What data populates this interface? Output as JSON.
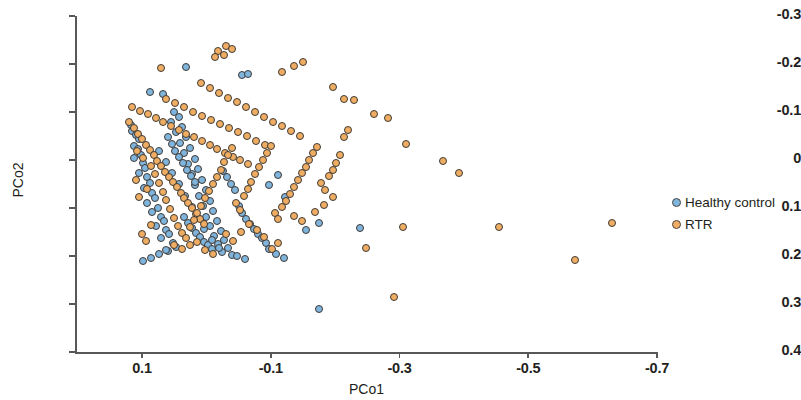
{
  "chart_data": {
    "type": "scatter",
    "title": "",
    "xlabel": "PCo1",
    "ylabel": "PCo2",
    "xlim": [
      0.16,
      -0.74
    ],
    "ylim": [
      -0.3,
      0.4
    ],
    "x_inverted": true,
    "y_inverted": true,
    "grid": false,
    "legend_position": "right",
    "xticks": [
      0.1,
      -0.1,
      -0.3,
      -0.5,
      -0.7
    ],
    "xtick_labels": [
      "0.1",
      "-0.1",
      "-0.3",
      "-0.5",
      "-0.7"
    ],
    "yticks": [
      -0.3,
      -0.2,
      -0.1,
      0,
      0.1,
      0.2,
      0.3,
      0.4
    ],
    "ytick_labels": [
      "-0.3",
      "-0.2",
      "-0.1",
      "0",
      "0.1",
      "0.2",
      "0.3",
      "0.4"
    ],
    "colors": {
      "healthy_control": "#7fb4dd",
      "rtr": "#efad63",
      "marker_edge": "#3f3a35",
      "axis": "#58585a",
      "text": "#231f20",
      "background": "#ffffff"
    },
    "series": [
      {
        "name": "Healthy control",
        "color": "#7fb4dd",
        "points": [
          [
            0.117,
            -0.072
          ],
          [
            0.115,
            -0.061
          ],
          [
            0.109,
            -0.053
          ],
          [
            0.104,
            -0.044
          ],
          [
            0.113,
            -0.03
          ],
          [
            0.106,
            -0.022
          ],
          [
            0.101,
            -0.01
          ],
          [
            0.112,
            -0.004
          ],
          [
            0.099,
            0.006
          ],
          [
            0.096,
            0.016
          ],
          [
            0.104,
            0.027
          ],
          [
            0.092,
            0.036
          ],
          [
            0.088,
            0.048
          ],
          [
            0.097,
            0.059
          ],
          [
            0.085,
            0.068
          ],
          [
            0.08,
            0.079
          ],
          [
            0.092,
            0.09
          ],
          [
            0.075,
            0.099
          ],
          [
            0.084,
            0.109
          ],
          [
            0.071,
            0.118
          ],
          [
            0.066,
            0.128
          ],
          [
            0.079,
            0.137
          ],
          [
            0.063,
            0.146
          ],
          [
            0.058,
            0.154
          ],
          [
            0.07,
            0.163
          ],
          [
            0.052,
            0.172
          ],
          [
            0.047,
            0.181
          ],
          [
            0.06,
            0.19
          ],
          [
            0.068,
            -0.137
          ],
          [
            0.05,
            -0.101
          ],
          [
            0.043,
            -0.09
          ],
          [
            0.055,
            -0.08
          ],
          [
            0.038,
            -0.069
          ],
          [
            0.047,
            -0.058
          ],
          [
            0.031,
            -0.047
          ],
          [
            0.041,
            -0.036
          ],
          [
            0.025,
            -0.025
          ],
          [
            0.035,
            -0.014
          ],
          [
            0.018,
            -0.003
          ],
          [
            0.029,
            0.008
          ],
          [
            0.013,
            0.019
          ],
          [
            0.023,
            0.03
          ],
          [
            0.007,
            0.041
          ],
          [
            0.017,
            0.052
          ],
          [
            0.001,
            0.063
          ],
          [
            0.011,
            0.074
          ],
          [
            -0.005,
            0.085
          ],
          [
            0.005,
            0.096
          ],
          [
            -0.011,
            0.107
          ],
          [
            0.0,
            0.118
          ],
          [
            -0.016,
            0.128
          ],
          [
            -0.006,
            0.138
          ],
          [
            -0.022,
            0.148
          ],
          [
            -0.012,
            0.158
          ],
          [
            -0.028,
            0.167
          ],
          [
            -0.018,
            0.176
          ],
          [
            -0.034,
            0.184
          ],
          [
            -0.024,
            0.192
          ],
          [
            -0.04,
            0.198
          ],
          [
            0.034,
            0.118
          ],
          [
            0.028,
            0.131
          ],
          [
            0.022,
            0.142
          ],
          [
            0.016,
            0.152
          ],
          [
            0.01,
            0.161
          ],
          [
            0.004,
            0.17
          ],
          [
            -0.002,
            0.178
          ],
          [
            -0.008,
            0.186
          ],
          [
            -0.05,
            0.095
          ],
          [
            -0.056,
            0.11
          ],
          [
            -0.062,
            0.122
          ],
          [
            -0.068,
            0.133
          ],
          [
            -0.074,
            0.144
          ],
          [
            -0.08,
            0.154
          ],
          [
            -0.086,
            0.163
          ],
          [
            -0.092,
            0.172
          ],
          [
            -0.044,
            0.063
          ],
          [
            -0.038,
            0.049
          ],
          [
            -0.032,
            0.035
          ],
          [
            -0.026,
            0.022
          ],
          [
            0.06,
            -0.048
          ],
          [
            0.054,
            -0.033
          ],
          [
            0.048,
            -0.019
          ],
          [
            0.042,
            -0.006
          ],
          [
            0.036,
            0.007
          ],
          [
            0.03,
            0.02
          ],
          [
            0.024,
            0.033
          ],
          [
            0.018,
            0.046
          ],
          [
            0.073,
            -0.018
          ],
          [
            0.063,
            0.005
          ],
          [
            0.053,
            0.028
          ],
          [
            0.043,
            0.051
          ],
          [
            0.033,
            0.074
          ],
          [
            0.023,
            0.097
          ],
          [
            0.013,
            0.12
          ],
          [
            0.003,
            0.143
          ],
          [
            -0.009,
            0.166
          ],
          [
            -0.019,
            0.184
          ],
          [
            0.088,
            -0.142
          ],
          [
            0.032,
            -0.193
          ],
          [
            -0.055,
            -0.178
          ],
          [
            -0.065,
            -0.18
          ],
          [
            -0.098,
            0.186
          ],
          [
            -0.108,
            0.196
          ],
          [
            -0.12,
            0.204
          ],
          [
            -0.155,
            0.145
          ],
          [
            -0.175,
            0.132
          ],
          [
            -0.238,
            0.142
          ],
          [
            -0.175,
            0.31
          ],
          [
            -0.06,
            0.206
          ],
          [
            -0.048,
            0.2
          ],
          [
            -0.098,
            0.053
          ],
          [
            -0.112,
            0.031
          ],
          [
            -0.122,
            0.078
          ],
          [
            0.098,
            0.21
          ],
          [
            0.086,
            0.205
          ],
          [
            0.074,
            0.196
          ],
          [
            0.062,
            0.188
          ]
        ]
      },
      {
        "name": "RTR",
        "color": "#efad63",
        "points": [
          [
            0.12,
            -0.08
          ],
          [
            0.112,
            -0.066
          ],
          [
            0.106,
            -0.055
          ],
          [
            0.1,
            -0.043
          ],
          [
            0.094,
            -0.032
          ],
          [
            0.088,
            -0.021
          ],
          [
            0.082,
            -0.01
          ],
          [
            0.076,
            0.002
          ],
          [
            0.07,
            0.013
          ],
          [
            0.064,
            0.024
          ],
          [
            0.058,
            0.035
          ],
          [
            0.052,
            0.046
          ],
          [
            0.046,
            0.057
          ],
          [
            0.04,
            0.068
          ],
          [
            0.034,
            0.079
          ],
          [
            0.028,
            0.09
          ],
          [
            0.022,
            0.101
          ],
          [
            0.016,
            0.112
          ],
          [
            0.01,
            0.123
          ],
          [
            0.004,
            0.134
          ],
          [
            0.115,
            -0.111
          ],
          [
            0.103,
            -0.103
          ],
          [
            0.091,
            -0.095
          ],
          [
            0.079,
            -0.087
          ],
          [
            0.067,
            -0.079
          ],
          [
            0.055,
            -0.071
          ],
          [
            0.043,
            -0.063
          ],
          [
            0.031,
            -0.055
          ],
          [
            0.019,
            -0.047
          ],
          [
            0.007,
            -0.039
          ],
          [
            -0.005,
            -0.031
          ],
          [
            -0.017,
            -0.023
          ],
          [
            -0.029,
            -0.015
          ],
          [
            -0.041,
            -0.007
          ],
          [
            -0.053,
            0.001
          ],
          [
            -0.065,
            0.009
          ],
          [
            0.063,
            -0.127
          ],
          [
            0.049,
            -0.118
          ],
          [
            0.035,
            -0.11
          ],
          [
            0.021,
            -0.101
          ],
          [
            0.007,
            -0.092
          ],
          [
            -0.007,
            -0.084
          ],
          [
            -0.021,
            -0.075
          ],
          [
            -0.035,
            -0.066
          ],
          [
            -0.049,
            -0.058
          ],
          [
            -0.063,
            -0.049
          ],
          [
            -0.077,
            -0.04
          ],
          [
            -0.091,
            -0.032
          ],
          [
            0.008,
            -0.16
          ],
          [
            -0.006,
            -0.15
          ],
          [
            -0.02,
            -0.14
          ],
          [
            -0.034,
            -0.13
          ],
          [
            -0.048,
            -0.12
          ],
          [
            -0.062,
            -0.11
          ],
          [
            -0.076,
            -0.1
          ],
          [
            -0.09,
            -0.09
          ],
          [
            -0.104,
            -0.08
          ],
          [
            -0.118,
            -0.07
          ],
          [
            -0.132,
            -0.06
          ],
          [
            -0.146,
            -0.05
          ],
          [
            -0.018,
            -0.228
          ],
          [
            -0.03,
            -0.238
          ],
          [
            -0.04,
            -0.232
          ],
          [
            -0.028,
            -0.218
          ],
          [
            -0.014,
            -0.214
          ],
          [
            0.07,
            -0.192
          ],
          [
            0.086,
            0.012
          ],
          [
            0.08,
            0.03
          ],
          [
            0.074,
            0.048
          ],
          [
            0.068,
            0.066
          ],
          [
            0.062,
            0.084
          ],
          [
            0.056,
            0.102
          ],
          [
            0.05,
            0.12
          ],
          [
            0.044,
            0.138
          ],
          [
            0.038,
            0.152
          ],
          [
            0.032,
            0.163
          ],
          [
            0.026,
            0.14
          ],
          [
            0.02,
            0.125
          ],
          [
            0.014,
            0.11
          ],
          [
            0.008,
            0.095
          ],
          [
            0.002,
            0.08
          ],
          [
            -0.004,
            0.065
          ],
          [
            -0.01,
            0.05
          ],
          [
            -0.016,
            0.035
          ],
          [
            -0.022,
            0.02
          ],
          [
            -0.028,
            0.005
          ],
          [
            -0.034,
            -0.01
          ],
          [
            -0.04,
            -0.025
          ],
          [
            -0.046,
            0.09
          ],
          [
            -0.052,
            0.105
          ],
          [
            -0.058,
            0.075
          ],
          [
            -0.064,
            0.06
          ],
          [
            -0.07,
            0.045
          ],
          [
            -0.076,
            0.03
          ],
          [
            -0.082,
            0.015
          ],
          [
            -0.088,
            0.0
          ],
          [
            -0.094,
            -0.015
          ],
          [
            -0.1,
            -0.03
          ],
          [
            -0.106,
            0.11
          ],
          [
            -0.112,
            0.122
          ],
          [
            -0.118,
            0.098
          ],
          [
            -0.124,
            0.085
          ],
          [
            -0.13,
            0.07
          ],
          [
            -0.136,
            0.056
          ],
          [
            -0.142,
            0.042
          ],
          [
            -0.148,
            0.028
          ],
          [
            -0.154,
            0.014
          ],
          [
            -0.16,
            0.0
          ],
          [
            -0.166,
            -0.014
          ],
          [
            -0.172,
            -0.028
          ],
          [
            -0.178,
            0.048
          ],
          [
            -0.184,
            0.062
          ],
          [
            -0.19,
            0.034
          ],
          [
            -0.196,
            0.02
          ],
          [
            -0.202,
            0.006
          ],
          [
            -0.208,
            -0.01
          ],
          [
            -0.214,
            -0.048
          ],
          [
            -0.22,
            -0.062
          ],
          [
            -0.118,
            -0.184
          ],
          [
            -0.136,
            -0.196
          ],
          [
            -0.15,
            -0.205
          ],
          [
            -0.196,
            -0.152
          ],
          [
            -0.214,
            -0.128
          ],
          [
            -0.23,
            -0.124
          ],
          [
            -0.26,
            -0.095
          ],
          [
            -0.282,
            -0.088
          ],
          [
            -0.31,
            -0.033
          ],
          [
            -0.392,
            0.028
          ],
          [
            -0.368,
            0.003
          ],
          [
            -0.455,
            0.14
          ],
          [
            -0.573,
            0.208
          ],
          [
            -0.63,
            0.131
          ],
          [
            -0.306,
            0.14
          ],
          [
            -0.292,
            0.285
          ],
          [
            -0.248,
            0.183
          ],
          [
            -0.182,
            0.093
          ],
          [
            -0.196,
            0.078
          ],
          [
            -0.168,
            0.108
          ],
          [
            -0.102,
            0.185
          ],
          [
            -0.112,
            0.172
          ],
          [
            -0.09,
            0.16
          ],
          [
            -0.078,
            0.146
          ],
          [
            -0.066,
            0.133
          ],
          [
            0.05,
            0.178
          ],
          [
            0.038,
            0.186
          ],
          [
            0.026,
            0.178
          ],
          [
            0.014,
            0.17
          ],
          [
            0.002,
            0.188
          ],
          [
            -0.01,
            0.196
          ],
          [
            0.108,
            -0.018
          ],
          [
            0.098,
            -0.004
          ],
          [
            0.092,
            0.06
          ],
          [
            0.086,
            0.135
          ],
          [
            0.104,
            0.078
          ],
          [
            0.11,
            0.042
          ],
          [
            0.1,
            0.155
          ],
          [
            0.094,
            0.168
          ],
          [
            -0.03,
            0.155
          ],
          [
            -0.042,
            0.168
          ],
          [
            -0.054,
            0.15
          ],
          [
            -0.136,
            0.116
          ],
          [
            -0.148,
            0.128
          ]
        ]
      }
    ]
  },
  "legend": {
    "items": [
      {
        "label": "Healthy control",
        "color": "#7fb4dd"
      },
      {
        "label": "RTR",
        "color": "#efad63"
      }
    ]
  }
}
